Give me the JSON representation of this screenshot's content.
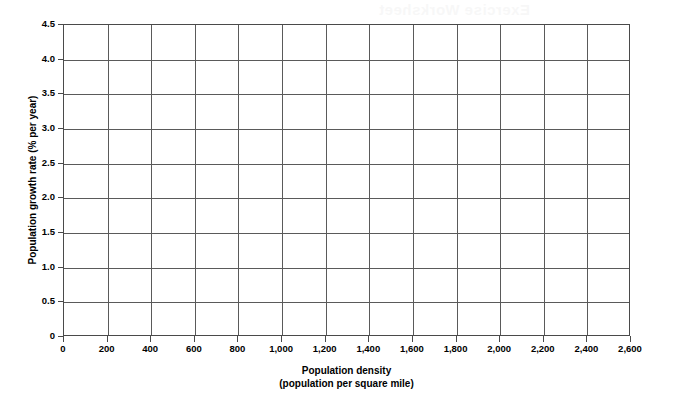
{
  "artifact": {
    "bleed_text": "Exercise Worksheet"
  },
  "chart_data": {
    "type": "scatter",
    "title": "",
    "subtitle": "",
    "xlabel": "Population density",
    "xlabel_line2": "(population per square mile)",
    "ylabel": "Population growth rate (% per year)",
    "xlim": [
      0,
      2600
    ],
    "ylim": [
      0,
      4.5
    ],
    "x_tick_step": 200,
    "y_tick_step": 0.5,
    "grid": true,
    "grid_axis": "both",
    "legend": false,
    "legend_position": "none",
    "x_tick_labels": [
      "0",
      "200",
      "400",
      "600",
      "800",
      "1,000",
      "1,200",
      "1,400",
      "1,600",
      "1,800",
      "2,000",
      "2,200",
      "2,400",
      "2,600"
    ],
    "x_tick_values": [
      0,
      200,
      400,
      600,
      800,
      1000,
      1200,
      1400,
      1600,
      1800,
      2000,
      2200,
      2400,
      2600
    ],
    "y_tick_labels": [
      "0",
      "0.5",
      "1.0",
      "1.5",
      "2.0",
      "2.5",
      "3.0",
      "3.5",
      "4.0",
      "4.5"
    ],
    "y_tick_values": [
      0,
      0.5,
      1.0,
      1.5,
      2.0,
      2.5,
      3.0,
      3.5,
      4.0,
      4.5
    ],
    "series": [],
    "values": [],
    "annotations": [],
    "colors": {
      "grid": "#5a5a5a",
      "axis": "#4a4a4a",
      "background": "#ffffff",
      "text": "#000000"
    }
  }
}
